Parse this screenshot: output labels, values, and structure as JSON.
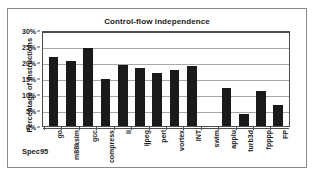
{
  "chart_data": {
    "type": "bar",
    "title": "Control-flow independence",
    "xlabel": "Spec95",
    "ylabel": "Percentage of instructions",
    "categories": [
      "go",
      "m88ksim",
      "gcc",
      "compress",
      "li",
      "ijpeg",
      "perl",
      "vortex",
      "INT",
      "swim",
      "applu",
      "turb3d",
      "fpppp",
      "FP"
    ],
    "values": [
      21.5,
      20.2,
      24.5,
      14.8,
      19.2,
      18.1,
      16.5,
      17.5,
      18.8,
      0,
      12.0,
      3.9,
      11.0,
      6.5
    ],
    "ylim": [
      0,
      30
    ],
    "ytick_values": [
      0,
      5,
      10,
      15,
      20,
      25,
      30
    ],
    "ytick_labels": [
      "0%",
      "5%",
      "10%",
      "15%",
      "20%",
      "25%",
      "30%"
    ],
    "grid": true,
    "legend": false,
    "bar_color": "#1a1a1a",
    "plot_background": "#ffffff",
    "gridline_color": "#a8a8a8",
    "axis_color": "#4d4d4d",
    "frame_color": "#8a8a8a",
    "unit": "percent"
  }
}
